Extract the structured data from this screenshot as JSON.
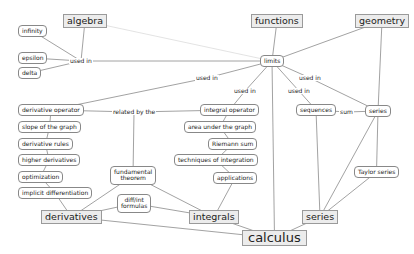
{
  "diagram": {
    "nodes": [
      {
        "id": "algebra",
        "label": "algebra",
        "kind": "topic"
      },
      {
        "id": "functions",
        "label": "functions",
        "kind": "topic"
      },
      {
        "id": "geometry",
        "label": "geometry",
        "kind": "topic"
      },
      {
        "id": "infinity",
        "label": "infinity",
        "kind": "concept"
      },
      {
        "id": "epsilon",
        "label": "epsilon",
        "kind": "concept"
      },
      {
        "id": "delta",
        "label": "delta",
        "kind": "concept"
      },
      {
        "id": "limits",
        "label": "limits",
        "kind": "concept"
      },
      {
        "id": "derivative_operator",
        "label": "derivative operator",
        "kind": "concept"
      },
      {
        "id": "slope",
        "label": "slope of the graph",
        "kind": "concept"
      },
      {
        "id": "derivative_rules",
        "label": "derivative rules",
        "kind": "concept"
      },
      {
        "id": "higher_derivatives",
        "label": "higher derivatives",
        "kind": "concept"
      },
      {
        "id": "optimization",
        "label": "optimization",
        "kind": "concept"
      },
      {
        "id": "implicit",
        "label": "implicit differentiation",
        "kind": "concept"
      },
      {
        "id": "fundamental",
        "label": "fundamental\ntheorem",
        "kind": "concept"
      },
      {
        "id": "diffint",
        "label": "diff/int\nformulas",
        "kind": "concept"
      },
      {
        "id": "integral_operator",
        "label": "integral operator",
        "kind": "concept"
      },
      {
        "id": "area",
        "label": "area under the graph",
        "kind": "concept"
      },
      {
        "id": "riemann",
        "label": "Riemann sum",
        "kind": "concept"
      },
      {
        "id": "techniques",
        "label": "techniques of integration",
        "kind": "concept"
      },
      {
        "id": "applications",
        "label": "applications",
        "kind": "concept"
      },
      {
        "id": "sequences",
        "label": "sequences",
        "kind": "concept"
      },
      {
        "id": "series_c",
        "label": "series",
        "kind": "concept"
      },
      {
        "id": "taylor",
        "label": "Taylor series",
        "kind": "concept"
      },
      {
        "id": "derivatives",
        "label": "derivatives",
        "kind": "topic"
      },
      {
        "id": "integrals",
        "label": "integrals",
        "kind": "topic"
      },
      {
        "id": "series_t",
        "label": "series",
        "kind": "topic"
      },
      {
        "id": "calculus",
        "label": "calculus",
        "kind": "big"
      }
    ],
    "link_labels": [
      {
        "id": "used_in_1",
        "text": "used in"
      },
      {
        "id": "used_in_2",
        "text": "used in"
      },
      {
        "id": "used_in_3",
        "text": "used in"
      },
      {
        "id": "used_in_4",
        "text": "used in"
      },
      {
        "id": "used_in_5",
        "text": "used in"
      },
      {
        "id": "related_by",
        "text": "related by the"
      },
      {
        "id": "sum",
        "text": "sum"
      }
    ],
    "edges": [
      [
        "infinity",
        "used_in_1"
      ],
      [
        "epsilon",
        "used_in_1"
      ],
      [
        "delta",
        "used_in_1"
      ],
      [
        "algebra",
        "used_in_1"
      ],
      [
        "used_in_1",
        "limits"
      ],
      [
        "algebra",
        "limits"
      ],
      [
        "functions",
        "limits"
      ],
      [
        "geometry",
        "limits"
      ],
      [
        "geometry",
        "series_c"
      ],
      [
        "limits",
        "used_in_2"
      ],
      [
        "used_in_2",
        "derivative_operator"
      ],
      [
        "limits",
        "used_in_3"
      ],
      [
        "used_in_3",
        "integral_operator"
      ],
      [
        "limits",
        "used_in_4"
      ],
      [
        "used_in_4",
        "sequences"
      ],
      [
        "limits",
        "used_in_5"
      ],
      [
        "used_in_5",
        "series_c"
      ],
      [
        "limits",
        "calculus"
      ],
      [
        "derivative_operator",
        "related_by"
      ],
      [
        "related_by",
        "integral_operator"
      ],
      [
        "related_by",
        "fundamental"
      ],
      [
        "derivative_operator",
        "slope"
      ],
      [
        "slope",
        "derivative_rules"
      ],
      [
        "derivative_rules",
        "higher_derivatives"
      ],
      [
        "higher_derivatives",
        "optimization"
      ],
      [
        "optimization",
        "implicit"
      ],
      [
        "implicit",
        "derivatives"
      ],
      [
        "integral_operator",
        "area"
      ],
      [
        "area",
        "riemann"
      ],
      [
        "riemann",
        "techniques"
      ],
      [
        "techniques",
        "applications"
      ],
      [
        "applications",
        "integrals"
      ],
      [
        "fundamental",
        "derivatives"
      ],
      [
        "fundamental",
        "integrals"
      ],
      [
        "diffint",
        "derivatives"
      ],
      [
        "diffint",
        "integrals"
      ],
      [
        "sequences",
        "sum"
      ],
      [
        "sum",
        "series_c"
      ],
      [
        "sequences",
        "series_t"
      ],
      [
        "series_c",
        "series_t"
      ],
      [
        "series_c",
        "taylor"
      ],
      [
        "taylor",
        "series_t"
      ],
      [
        "derivatives",
        "calculus"
      ],
      [
        "integrals",
        "calculus"
      ],
      [
        "series_t",
        "calculus"
      ]
    ]
  }
}
